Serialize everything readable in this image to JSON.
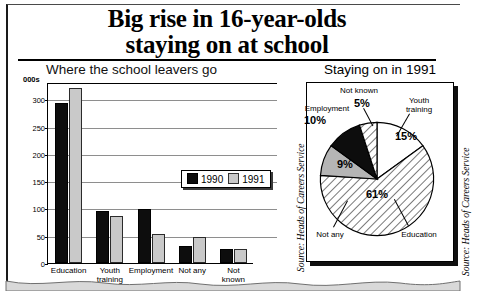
{
  "headline": {
    "line1": "Big rise in 16-year-olds",
    "line2": "staying on at school"
  },
  "source_note": "Source: Heads of Careers Service",
  "caption": "",
  "bar_chart": {
    "title": "Where the school leavers go",
    "units_label": "000s",
    "legend": [
      {
        "label": "1990",
        "color": "#0d0d0d"
      },
      {
        "label": "1991",
        "color": "#c9c9c9"
      }
    ]
  },
  "pie_chart": {
    "title": "Staying on in 1991"
  },
  "chart_data": [
    {
      "type": "bar",
      "title": "Where the school leavers go",
      "xlabel": "",
      "ylabel": "000s",
      "ylim": [
        0,
        330
      ],
      "yticks": [
        0,
        50,
        100,
        150,
        200,
        250,
        300
      ],
      "grid": true,
      "legend_position": "inside-top-right",
      "categories": [
        "Education",
        "Youth\ntraining",
        "Employment",
        "Not any",
        "Not known"
      ],
      "series": [
        {
          "name": "1990",
          "color": "#0d0d0d",
          "values": [
            293,
            95,
            99,
            32,
            25
          ]
        },
        {
          "name": "1991",
          "color": "#c9c9c9",
          "values": [
            320,
            87,
            54,
            48,
            25
          ]
        }
      ]
    },
    {
      "type": "pie",
      "title": "Staying on in 1991",
      "labels": [
        "Youth training",
        "Education",
        "Not any",
        "Employment",
        "Not known"
      ],
      "values": [
        15,
        61,
        9,
        10,
        5
      ],
      "value_labels": [
        "15%",
        "61%",
        "9%",
        "10%",
        "5%"
      ],
      "fills": [
        "white",
        "hatch",
        "gray",
        "black",
        "hatch"
      ]
    }
  ]
}
